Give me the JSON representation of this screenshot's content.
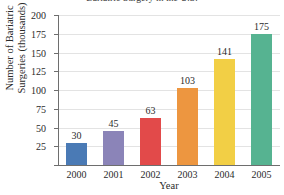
{
  "chart_data": {
    "type": "bar",
    "title": "Bariatric Surgery in the U.S.",
    "xlabel": "Year",
    "ylabel_line1": "Number of Bariatric",
    "ylabel_line2": "Surgeries (thousands)",
    "categories": [
      "2000",
      "2001",
      "2002",
      "2003",
      "2004",
      "2005"
    ],
    "values": [
      30,
      45,
      63,
      103,
      141,
      175
    ],
    "value_labels": [
      "30",
      "45",
      "63",
      "103",
      "141",
      "175"
    ],
    "colors": [
      "#4a7ab5",
      "#8b84b8",
      "#e24a4a",
      "#ed9640",
      "#f2cf45",
      "#56b391"
    ],
    "ylim": [
      0,
      200
    ],
    "yticks": [
      25,
      50,
      75,
      100,
      125,
      150,
      175,
      200
    ],
    "ytick_labels": [
      "25",
      "50",
      "75",
      "100",
      "125",
      "150",
      "175",
      "200"
    ],
    "grid": true,
    "legend": "none"
  }
}
